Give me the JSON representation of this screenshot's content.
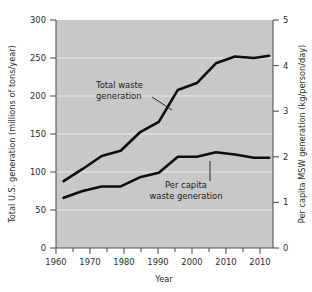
{
  "chart_data": {
    "type": "line",
    "title": "",
    "xlabel": "Year",
    "grid": "horizontal-white",
    "legend": "none (inline annotations)",
    "plot_background": "#c8c8c8",
    "line_color": "#0d0d0d",
    "xlim": [
      1958,
      2015
    ],
    "x_major_ticks": [
      1960,
      1970,
      1980,
      1990,
      2000,
      2010
    ],
    "x_minor_ticks": [
      1965,
      1975,
      1985,
      1995,
      2005
    ],
    "axes": [
      {
        "id": "left",
        "label": "Total U.S. generation (millions of tons/year)",
        "ticks": [
          0,
          50,
          100,
          150,
          200,
          250,
          300
        ],
        "lim": [
          0,
          300
        ]
      },
      {
        "id": "right",
        "label": "Per capita MSW generation (kg/person/day)",
        "ticks": [
          0,
          1,
          2,
          3,
          4,
          5
        ],
        "lim": [
          0,
          5
        ]
      }
    ],
    "series": [
      {
        "name": "Total waste generation",
        "axis": "left",
        "units": "millions of tons/year",
        "x": [
          1960,
          1965,
          1970,
          1975,
          1980,
          1985,
          1990,
          1995,
          2000,
          2005,
          2010,
          2014
        ],
        "values": [
          88,
          104,
          121,
          128,
          152,
          166,
          208,
          217,
          243,
          252,
          250,
          253
        ]
      },
      {
        "name": "Per capita waste generation",
        "axis": "right",
        "units": "kg/person/day",
        "x": [
          1960,
          1965,
          1970,
          1975,
          1980,
          1985,
          1990,
          1995,
          2000,
          2005,
          2010,
          2014
        ],
        "values": [
          1.1,
          1.25,
          1.35,
          1.35,
          1.55,
          1.65,
          2.0,
          2.0,
          2.1,
          2.05,
          1.98,
          1.98
        ]
      }
    ],
    "annotations": [
      {
        "id": "total-waste",
        "line1": "Total waste",
        "line2": "generation",
        "points_to_series": "Total waste generation"
      },
      {
        "id": "per-capita",
        "line1": "Per capita",
        "line2": "waste generation",
        "points_to_series": "Per capita waste generation"
      }
    ]
  }
}
